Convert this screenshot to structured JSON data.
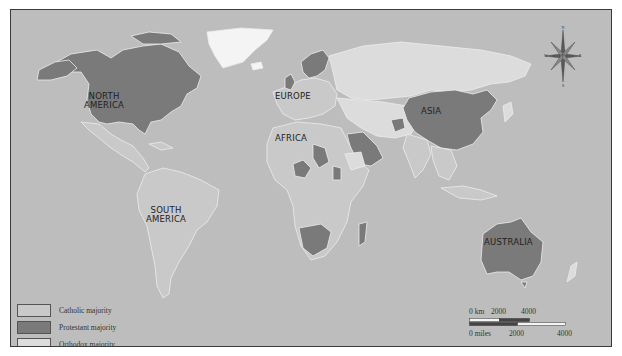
{
  "map": {
    "colors": {
      "ocean": "#bdbdbd",
      "catholic": "#c9c9c9",
      "protestant": "#7a7a7a",
      "orthodox": "#dcdcdc",
      "unaffiliated": "#f4f4f4",
      "border": "#eeeeee",
      "frame": "#3a3a3a"
    },
    "region_labels": {
      "north_america": [
        "NORTH",
        "AMERICA"
      ],
      "south_america": [
        "SOUTH",
        "AMERICA"
      ],
      "europe": "EUROPE",
      "africa": "AFRICA",
      "asia": "ASIA",
      "australia": "AUSTRALIA"
    },
    "compass": {
      "n": "N",
      "s": "S",
      "e": "E",
      "w": "W"
    }
  },
  "legend": {
    "items": [
      {
        "label": "Catholic majority",
        "color": "#c9c9c9"
      },
      {
        "label": "Protestant majority",
        "color": "#7a7a7a"
      },
      {
        "label": "Orthodox majority",
        "color": "#dcdcdc"
      }
    ]
  },
  "scale_bar": {
    "km_labels": [
      "0 km",
      "2000",
      "4000"
    ],
    "mile_labels": [
      "0 miles",
      "2000",
      "4000"
    ]
  }
}
